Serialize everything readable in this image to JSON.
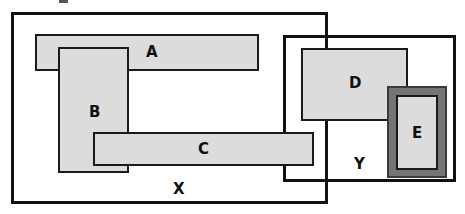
{
  "diagram": {
    "colors": {
      "background": "#ffffff",
      "stroke": "#111111",
      "block_fill": "#dcdcdc",
      "block_stroke": "#1a1a1a",
      "dark_fill": "#757575",
      "dark_stroke": "#3a3a3a"
    },
    "containers": [
      {
        "id": "X",
        "label": "X",
        "x": 11,
        "y": 12,
        "width": 317,
        "height": 192,
        "label_x": 173,
        "label_y": 182,
        "font_size": 15
      },
      {
        "id": "Y",
        "label": "Y",
        "x": 283,
        "y": 35,
        "width": 173,
        "height": 147,
        "label_x": 354,
        "label_y": 157,
        "font_size": 15
      }
    ],
    "blocks": [
      {
        "id": "A",
        "label": "A",
        "x": 35,
        "y": 34,
        "width": 224,
        "height": 37,
        "label_x": 146,
        "label_y": 45,
        "font_size": 15,
        "style": "light"
      },
      {
        "id": "B",
        "label": "B",
        "x": 58,
        "y": 47,
        "width": 71,
        "height": 126,
        "label_x": 89,
        "label_y": 105,
        "font_size": 15,
        "style": "light"
      },
      {
        "id": "C",
        "label": "C",
        "x": 93,
        "y": 132,
        "width": 221,
        "height": 34,
        "label_x": 198,
        "label_y": 142,
        "font_size": 15,
        "style": "light"
      },
      {
        "id": "D",
        "label": "D",
        "x": 301,
        "y": 48,
        "width": 107,
        "height": 73,
        "label_x": 349,
        "label_y": 76,
        "font_size": 15,
        "style": "light"
      },
      {
        "id": "E-frame",
        "label": "",
        "x": 387,
        "y": 86,
        "width": 60,
        "height": 92,
        "label_x": 0,
        "label_y": 0,
        "font_size": 15,
        "style": "dark"
      },
      {
        "id": "E",
        "label": "E",
        "x": 396,
        "y": 95,
        "width": 42,
        "height": 75,
        "label_x": 412,
        "label_y": 126,
        "font_size": 15,
        "style": "light"
      }
    ],
    "artifacts": [
      {
        "id": "top-mark",
        "x": 59,
        "y": 0,
        "width": 9,
        "height": 3
      }
    ]
  }
}
